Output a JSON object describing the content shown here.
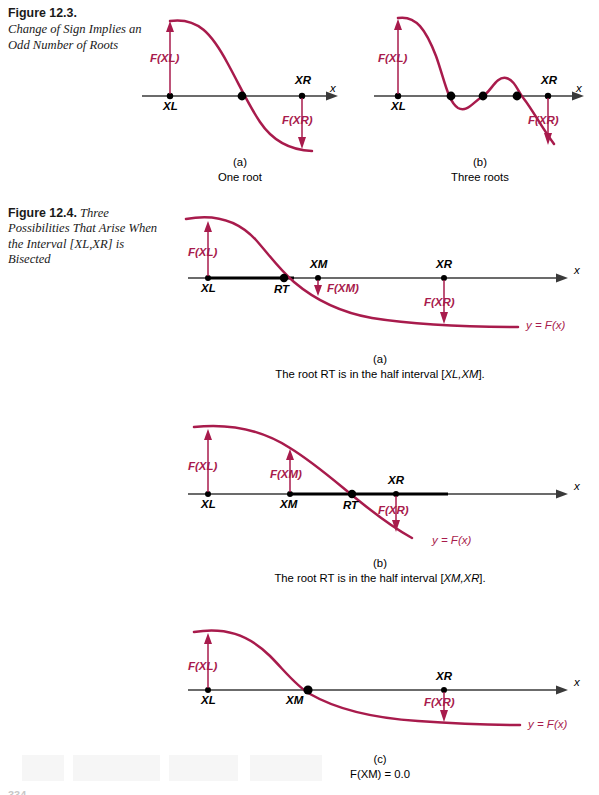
{
  "page": {
    "page_number_fragment": "334",
    "curve_color": "#a81b4c",
    "axis_color": "#3a3a3a",
    "text_color": "#000000"
  },
  "figures": [
    {
      "id": "fig-12-3",
      "label": "Figure 12.3.",
      "caption": "Change of Sign Implies an Odd Number of Roots",
      "caption_style": "block",
      "panels": [
        {
          "id": "fig123-a",
          "tag": "(a)",
          "description": "One root",
          "axis_label": "x",
          "points": [
            {
              "name": "XL",
              "label": "XL"
            },
            {
              "name": "XR",
              "label": "XR"
            }
          ],
          "value_labels": [
            {
              "name": "F(XL)",
              "label": "F(XL)",
              "direction": "up"
            },
            {
              "name": "F(XR)",
              "label": "F(XR)",
              "direction": "down"
            }
          ],
          "root_count": 1
        },
        {
          "id": "fig123-b",
          "tag": "(b)",
          "description": "Three roots",
          "axis_label": "x",
          "points": [
            {
              "name": "XL",
              "label": "XL"
            },
            {
              "name": "XR",
              "label": "XR"
            }
          ],
          "value_labels": [
            {
              "name": "F(XL)",
              "label": "F(XL)",
              "direction": "up"
            },
            {
              "name": "F(XR)",
              "label": "F(XR)",
              "direction": "down"
            }
          ],
          "root_count": 3
        }
      ]
    },
    {
      "id": "fig-12-4",
      "label": "Figure 12.4.",
      "caption": "Three Possibilities That Arise When the Interval [XL,XR] is Bisected",
      "caption_style": "inline",
      "panels": [
        {
          "id": "fig124-a",
          "tag": "(a)",
          "description_prefix": "The root RT is in the half interval [",
          "description_interval": "XL,XM",
          "description_suffix": "].",
          "axis_label": "x",
          "curve_label": "y = F(x)",
          "points": [
            {
              "name": "XL",
              "label": "XL"
            },
            {
              "name": "RT",
              "label": "RT"
            },
            {
              "name": "XM",
              "label": "XM"
            },
            {
              "name": "XR",
              "label": "XR"
            }
          ],
          "value_labels": [
            {
              "name": "F(XL)",
              "label": "F(XL)",
              "direction": "up"
            },
            {
              "name": "F(XM)",
              "label": "F(XM)",
              "direction": "down"
            },
            {
              "name": "F(XR)",
              "label": "F(XR)",
              "direction": "down"
            }
          ],
          "highlighted_interval": "XL,XM"
        },
        {
          "id": "fig124-b",
          "tag": "(b)",
          "description_prefix": "The root RT is in the half interval [",
          "description_interval": "XM,XR",
          "description_suffix": "].",
          "axis_label": "x",
          "curve_label": "y = F(x)",
          "points": [
            {
              "name": "XL",
              "label": "XL"
            },
            {
              "name": "XM",
              "label": "XM"
            },
            {
              "name": "RT",
              "label": "RT"
            },
            {
              "name": "XR",
              "label": "XR"
            }
          ],
          "value_labels": [
            {
              "name": "F(XL)",
              "label": "F(XL)",
              "direction": "up"
            },
            {
              "name": "F(XM)",
              "label": "F(XM)",
              "direction": "up"
            },
            {
              "name": "F(XR)",
              "label": "F(XR)",
              "direction": "down"
            }
          ],
          "highlighted_interval": "XM,XR"
        },
        {
          "id": "fig124-c",
          "tag": "(c)",
          "description": "F(XM) = 0.0",
          "axis_label": "x",
          "curve_label": "y = F(x)",
          "points": [
            {
              "name": "XL",
              "label": "XL"
            },
            {
              "name": "XM",
              "label": "XM"
            },
            {
              "name": "XR",
              "label": "XR"
            }
          ],
          "value_labels": [
            {
              "name": "F(XL)",
              "label": "F(XL)",
              "direction": "up"
            },
            {
              "name": "F(XR)",
              "label": "F(XR)",
              "direction": "down"
            }
          ],
          "root_at": "XM"
        }
      ]
    }
  ]
}
